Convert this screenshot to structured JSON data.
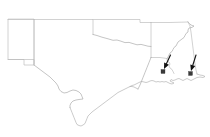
{
  "figure": {
    "kind": "outline-map",
    "region_label": "South Central United States",
    "background_color": "#ffffff",
    "outline_color": "#b9b9b9",
    "marker_color": "#3a3a3a",
    "arrow_color": "#111111",
    "width_px": 210,
    "height_px": 137
  },
  "states": [
    {
      "name": "New Mexico",
      "id": "new-mexico"
    },
    {
      "name": "Oklahoma",
      "id": "oklahoma"
    },
    {
      "name": "Texas",
      "id": "texas"
    },
    {
      "name": "Arkansas",
      "id": "arkansas"
    },
    {
      "name": "Louisiana",
      "id": "louisiana"
    },
    {
      "name": "Mississippi",
      "id": "mississippi"
    }
  ],
  "markers": [
    {
      "id": "marker-louisiana",
      "label": "",
      "x": 163.0,
      "y": 71.5,
      "size": 4.0
    },
    {
      "id": "marker-gulf-coast",
      "label": "",
      "x": 190.5,
      "y": 73.5,
      "size": 4.0
    }
  ],
  "annotations": [
    {
      "id": "arrow-left",
      "label": "",
      "from_x": 170.5,
      "from_y": 55.0,
      "to_x": 164.0,
      "to_y": 69.0
    },
    {
      "id": "arrow-right",
      "label": "",
      "from_x": 196.0,
      "from_y": 55.0,
      "to_x": 191.0,
      "to_y": 71.0
    }
  ]
}
